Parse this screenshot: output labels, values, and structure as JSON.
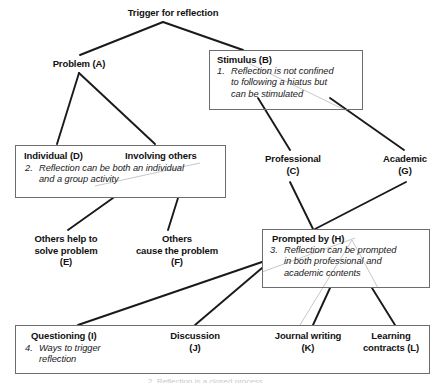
{
  "diagram": {
    "title": "Trigger for reflection",
    "root": {
      "label": "Trigger for reflection"
    },
    "nodes": {
      "problem_a": {
        "label": "Problem (A)"
      },
      "professional_c": {
        "label": "Professional\n(C)"
      },
      "academic_g": {
        "label": "Academic\n(G)"
      },
      "others_help_e": {
        "label": "Others help to\nsolve problem\n(E)"
      },
      "others_cause_f": {
        "label": "Others\ncause the problem\n(F)"
      }
    },
    "boxes": {
      "stimulus_b": {
        "title": "Stimulus (B)",
        "note_number": "1.",
        "note_text": "Reflection is not confined\nto following a hiatus but\ncan be stimulated"
      },
      "individual_d": {
        "title_left": "Individual (D)",
        "title_right": "Involving others",
        "note_number": "2.",
        "note_text": "Reflection can be both an individual\nand a group activity"
      },
      "prompted_h": {
        "title": "Prompted by (H)",
        "note_number": "3.",
        "note_text": "Reflection can be prompted\nin both professional and\nacademic contents"
      },
      "methods_row": {
        "questioning_i": "Questioning (I)",
        "note_number": "4.",
        "note_text": "Ways to trigger\nreflection",
        "discussion_j": "Discussion\n(J)",
        "journal_k": "Journal writing\n(K)",
        "learning_l": "Learning\ncontracts (L)"
      }
    },
    "colors": {
      "text": "#111111",
      "line": "#1a1a1a",
      "box_border": "#6d6d6d",
      "background": "#ffffff"
    },
    "cut_off_caption": "2. Reflection is a closed process"
  }
}
